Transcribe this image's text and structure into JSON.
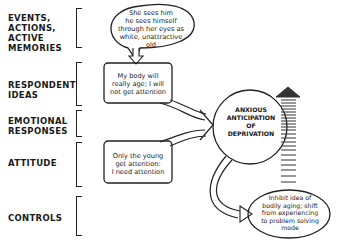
{
  "levels": [
    {
      "lines": [
        "EVENTS,",
        "ACTIONS,",
        "ACTIVE",
        "MEMORIES"
      ]
    },
    {
      "lines": [
        "RESPONDENT",
        "IDEAS"
      ]
    },
    {
      "lines": [
        "EMOTIONAL",
        "RESPONSES"
      ]
    },
    {
      "lines": [
        "ATTITUDE"
      ]
    },
    {
      "lines": [
        "CONTROLS"
      ]
    }
  ],
  "nodes": {
    "event_bubble": {
      "lines": [
        "She sees him",
        "he sees himself",
        "through her eyes as",
        "white, unattractive",
        "old"
      ]
    },
    "idea_box": {
      "lines": [
        "My body will",
        "really age; I will",
        "not get attention"
      ]
    },
    "emotion_circle": {
      "lines": [
        "ANXIOUS",
        "ANTICIPATION",
        "OF",
        "DEPRIVATION"
      ]
    },
    "attitude_box": {
      "lines": [
        "Only the young",
        "get attention:",
        "I need attention"
      ]
    },
    "control_ellipse": {
      "lines": [
        "Inhibit idea of",
        "bodily aging; shift",
        "from experiencing",
        "to problem solving",
        "mode"
      ]
    }
  }
}
